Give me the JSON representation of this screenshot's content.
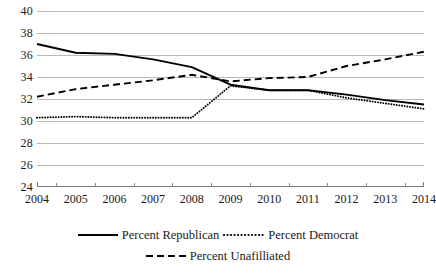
{
  "chart_data": {
    "type": "line",
    "title": "",
    "subtitle": "",
    "xlabel": "",
    "ylabel": "",
    "categories": [
      "2004",
      "2005",
      "2006",
      "2007",
      "2008",
      "2009",
      "2010",
      "2011",
      "2012",
      "2013",
      "2014"
    ],
    "x": [
      2004,
      2005,
      2006,
      2007,
      2008,
      2009,
      2010,
      2011,
      2012,
      2013,
      2014
    ],
    "xlim": [
      2004,
      2014
    ],
    "ylim": [
      24,
      40
    ],
    "ytick_step": 2,
    "yticks": [
      24,
      26,
      28,
      30,
      32,
      34,
      36,
      38,
      40
    ],
    "ytick_labels": [
      "24",
      "26",
      "28",
      "30",
      "32",
      "34",
      "36",
      "38",
      "40"
    ],
    "grid": "horizontal",
    "legend_position": "bottom",
    "series": [
      {
        "name": "Percent Republican",
        "style": "solid",
        "color": "#000000",
        "values": [
          37.0,
          36.2,
          36.1,
          35.6,
          34.9,
          33.3,
          32.8,
          32.8,
          32.4,
          31.9,
          31.5
        ]
      },
      {
        "name": "Percent Democrat",
        "style": "dotted",
        "color": "#000000",
        "values": [
          30.3,
          30.4,
          30.3,
          30.3,
          30.3,
          33.2,
          32.8,
          32.8,
          32.1,
          31.6,
          31.1
        ]
      },
      {
        "name": "Percent Unafilliated",
        "style": "dashed",
        "color": "#000000",
        "values": [
          32.2,
          32.9,
          33.3,
          33.7,
          34.2,
          33.6,
          33.9,
          34.0,
          35.0,
          35.6,
          36.3
        ]
      }
    ]
  },
  "legend": {
    "items": [
      {
        "label": "Percent Republican",
        "style": "solid"
      },
      {
        "label": "Percent Democrat",
        "style": "dotted"
      },
      {
        "label": "Percent Unafilliated",
        "style": "dashed"
      }
    ]
  }
}
